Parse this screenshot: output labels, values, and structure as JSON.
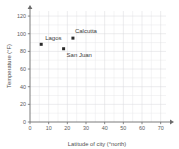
{
  "chart_data": {
    "type": "scatter",
    "title": "",
    "xlabel": "Latitude of city (°north)",
    "ylabel": "Temperature (°F)",
    "xlim": [
      0,
      75
    ],
    "ylim": [
      0,
      128
    ],
    "xticks": [
      0,
      10,
      20,
      30,
      40,
      50,
      60,
      70
    ],
    "yticks": [
      0,
      20,
      40,
      60,
      80,
      100,
      120
    ],
    "xtick_labels": [
      "0",
      "10",
      "20",
      "30",
      "40",
      "50",
      "60",
      "70"
    ],
    "ytick_labels": [
      "0",
      "20",
      "40",
      "60",
      "80",
      "100",
      "120"
    ],
    "x_minor_step": 5,
    "y_minor_step": 10,
    "grid": true,
    "legend": "none",
    "marker_color": "#2b2b2b",
    "grid_color": "#e8e8ea",
    "axis_color": "#6b6b6b",
    "points": [
      {
        "name": "Lagos",
        "x": 6,
        "y": 88,
        "label_dx": 4,
        "label_dy": -4
      },
      {
        "name": "San Juan",
        "x": 18,
        "y": 83,
        "label_dx": 3,
        "label_dy": 8
      },
      {
        "name": "Calcutta",
        "x": 23,
        "y": 95,
        "label_dx": 2,
        "label_dy": -5
      }
    ]
  }
}
